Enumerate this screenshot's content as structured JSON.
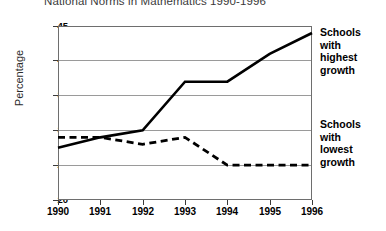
{
  "chart_data": {
    "type": "line",
    "title": "National Norms in Mathematics 1990-1996",
    "xlabel": "",
    "ylabel": "Percentage",
    "categories": [
      "1990",
      "1991",
      "1992",
      "1993",
      "1994",
      "1995",
      "1996"
    ],
    "x": [
      1990,
      1991,
      1992,
      1993,
      1994,
      1995,
      1996
    ],
    "ylim": [
      20,
      45
    ],
    "yticks": [
      20,
      25,
      30,
      35,
      40,
      45
    ],
    "grid": "horizontal",
    "legend_position": "right",
    "series": [
      {
        "name": "Schools with highest growth",
        "style": "solid",
        "color": "#000000",
        "values": [
          27.5,
          29,
          30,
          37,
          37,
          41,
          44
        ]
      },
      {
        "name": "Schools with lowest growth",
        "style": "dashed",
        "color": "#000000",
        "values": [
          29,
          29,
          28,
          29,
          25,
          25,
          25
        ]
      }
    ],
    "annotations": [
      {
        "id": "high",
        "text": "Schools with highest growth"
      },
      {
        "id": "low",
        "text": "Schools with lowest growth"
      }
    ]
  },
  "axes": {
    "y_labels": [
      "45",
      "40",
      "35",
      "30",
      "25",
      "20"
    ],
    "x_labels": [
      "1990",
      "1991",
      "1992",
      "1993",
      "1994",
      "1995",
      "1996"
    ],
    "y_title": "Percentage"
  },
  "legend": {
    "high_line1": "Schools",
    "high_line2": "with",
    "high_line3": "highest",
    "high_line4": "growth",
    "low_line1": "Schools",
    "low_line2": "with",
    "low_line3": "lowest",
    "low_line4": "growth"
  },
  "title": "National Norms in Mathematics 1990-1996"
}
